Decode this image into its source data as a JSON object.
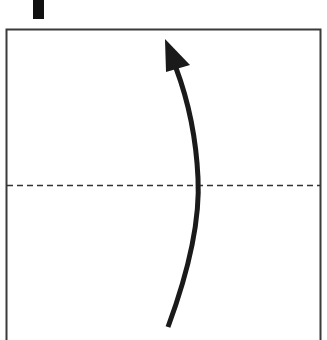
{
  "diagram": {
    "type": "fold-instruction",
    "colors": {
      "background": "#ffffff",
      "outline": "#3a3a3a",
      "arrow": "#1a1a1a",
      "marker": "#111111",
      "fold_line": "#333333"
    },
    "elements": {
      "marker": {
        "x": 33,
        "y": 0,
        "width": 11,
        "height": 19
      },
      "paper": {
        "left": 6,
        "top": 29,
        "right": 320,
        "bottom": 340
      },
      "fold_line": {
        "y": 185,
        "style": "dashed"
      },
      "arrow": {
        "start": [
          170,
          328
        ],
        "tip": [
          163,
          40
        ],
        "direction": "up"
      }
    }
  }
}
